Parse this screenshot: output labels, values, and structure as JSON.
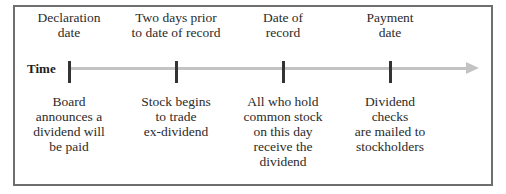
{
  "diagram": {
    "title": "",
    "axis_label": "Time",
    "events": [
      {
        "top_label": "Declaration\ndate",
        "bottom_label": "Board\nannounces a\ndividend will\nbe paid"
      },
      {
        "top_label": "Two days prior\nto date of record",
        "bottom_label": "Stock begins\nto trade\nex-dividend"
      },
      {
        "top_label": "Date of\nrecord",
        "bottom_label": "All who hold\ncommon stock\non this day\nreceive the\ndividend"
      },
      {
        "top_label": "Payment\ndate",
        "bottom_label": "Dividend\nchecks\nare mailed to\nstockholders"
      }
    ]
  },
  "colors": {
    "border": "#6e6e6e",
    "axis": "#c3c3c3",
    "tick": "#333333",
    "text": "#2b2b2b"
  }
}
